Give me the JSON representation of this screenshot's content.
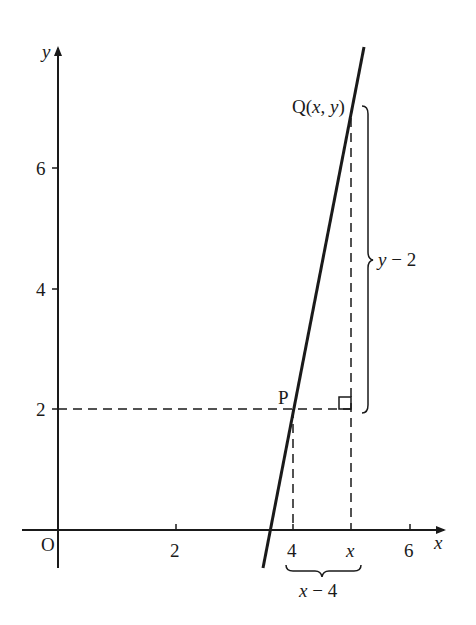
{
  "figure": {
    "type": "coordinate-geometry-diagram",
    "axes": {
      "x_label": "x",
      "y_label": "y",
      "origin_label": "O",
      "x_ticks": [
        "2",
        "4",
        "6"
      ],
      "y_ticks": [
        "2",
        "4",
        "6"
      ],
      "x_variable_tick": "x"
    },
    "points": {
      "P": {
        "label": "P",
        "coords": [
          4,
          2
        ]
      },
      "Q": {
        "label": "Q(x, y)",
        "label_prefix": "Q(",
        "label_x": "x",
        "label_sep": ", ",
        "label_y": "y",
        "label_suffix": ")"
      }
    },
    "annotations": {
      "vertical_brace": "y − 2",
      "vertical_brace_var": "y",
      "vertical_brace_rest": " − 2",
      "horizontal_brace": "x − 4",
      "horizontal_brace_var": "x",
      "horizontal_brace_rest": " − 4",
      "right_angle_marker": true
    },
    "colors": {
      "ink": "#1a1a1a",
      "background": "#ffffff"
    }
  }
}
